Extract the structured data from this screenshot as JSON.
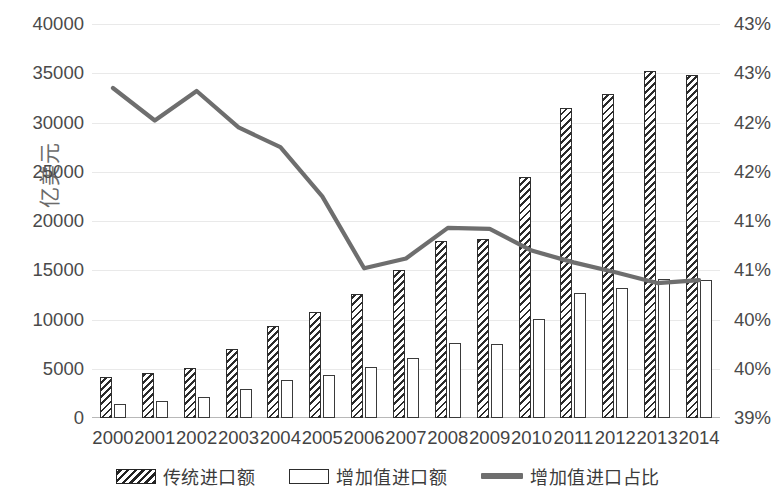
{
  "chart_data": {
    "type": "bar",
    "title": "",
    "xlabel": "",
    "ylabel": "亿美元",
    "y2label": "",
    "grid": true,
    "legend_position": "bottom",
    "categories": [
      "2000",
      "2001",
      "2002",
      "2003",
      "2004",
      "2005",
      "2006",
      "2007",
      "2008",
      "2009",
      "2010",
      "2011",
      "2012",
      "2013",
      "2014"
    ],
    "ylim": [
      0,
      40000
    ],
    "y_ticks": [
      "0",
      "5000",
      "10000",
      "15000",
      "20000",
      "25000",
      "30000",
      "35000",
      "40000"
    ],
    "y2lim": [
      39,
      43
    ],
    "y2_ticks": [
      "39%",
      "40%",
      "40%",
      "41%",
      "41%",
      "42%",
      "42%",
      "43%",
      "43%"
    ],
    "series": [
      {
        "name": "传统进口额",
        "type": "bar",
        "style": "hatched",
        "color": "#2b2b2b",
        "values": [
          4200,
          4600,
          5100,
          7000,
          9300,
          10800,
          12600,
          15000,
          18000,
          18200,
          24500,
          31500,
          32900,
          35200,
          34800
        ]
      },
      {
        "name": "增加值进口额",
        "type": "bar",
        "style": "outline",
        "color": "#ffffff",
        "values": [
          1450,
          1700,
          2100,
          2900,
          3900,
          4400,
          5200,
          6100,
          7600,
          7500,
          10100,
          12700,
          13200,
          14100,
          14000
        ]
      },
      {
        "name": "增加值进口占比",
        "type": "line",
        "color": "#6e6e6e",
        "unit": "%",
        "values": [
          42.35,
          42.02,
          42.32,
          41.95,
          41.75,
          41.25,
          40.52,
          40.62,
          40.93,
          40.92,
          40.7,
          40.58,
          40.48,
          40.37,
          40.4
        ]
      }
    ],
    "legend": [
      {
        "label": "传统进口额",
        "marker": "hatched-bar-swatch"
      },
      {
        "label": "增加值进口额",
        "marker": "outline-bar-swatch"
      },
      {
        "label": "增加值进口占比",
        "marker": "line-swatch"
      }
    ]
  }
}
